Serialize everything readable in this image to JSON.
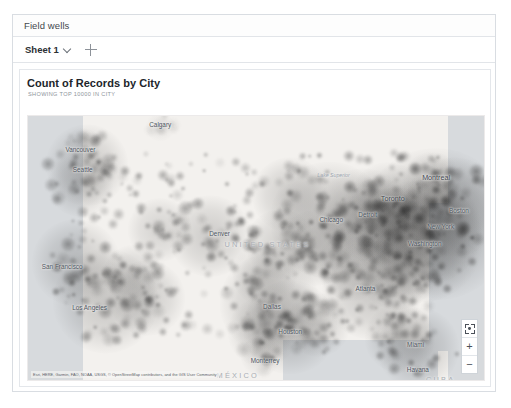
{
  "fieldwells": {
    "label": "Field wells"
  },
  "sheetbar": {
    "tab_label": "Sheet 1",
    "chevron_icon": "chevron-down-icon",
    "add_icon": "plus-icon"
  },
  "visual": {
    "title": "Count of Records by City",
    "subtitle": "SHOWING TOP 10000 IN CITY"
  },
  "map": {
    "attribution": "Esri, HERE, Garmin, FAO, NOAA, USGS, © OpenStreetMap contributors, and the GIS User Community",
    "controls": {
      "recenter_icon": "focus-recenter-icon",
      "zoom_in_label": "+",
      "zoom_out_label": "−"
    },
    "colors": {
      "land": "#f7f5f2",
      "water": "#d7dadd",
      "heat": "#4a4a4a",
      "card_border": "#e4e7eb",
      "panel_border": "#d9dde2"
    },
    "labels": [
      {
        "text": "Calgary",
        "x": 29.0,
        "y": 3.0,
        "kind": "city"
      },
      {
        "text": "Vancouver",
        "x": 11.5,
        "y": 12.5,
        "kind": "city"
      },
      {
        "text": "Seattle",
        "x": 12.0,
        "y": 20.0,
        "kind": "city"
      },
      {
        "text": "San Francisco",
        "x": 7.5,
        "y": 57.0,
        "kind": "city"
      },
      {
        "text": "Los Angeles",
        "x": 13.5,
        "y": 72.5,
        "kind": "city"
      },
      {
        "text": "Denver",
        "x": 42.0,
        "y": 44.5,
        "kind": "city"
      },
      {
        "text": "Dallas",
        "x": 53.5,
        "y": 72.0,
        "kind": "city"
      },
      {
        "text": "Houston",
        "x": 57.5,
        "y": 81.5,
        "kind": "city"
      },
      {
        "text": "Monterrey",
        "x": 52.0,
        "y": 92.5,
        "kind": "city"
      },
      {
        "text": "Chicago",
        "x": 66.5,
        "y": 39.0,
        "kind": "city"
      },
      {
        "text": "Detroit",
        "x": 74.5,
        "y": 37.0,
        "kind": "city"
      },
      {
        "text": "Toronto",
        "x": 80.0,
        "y": 31.0,
        "kind": "major"
      },
      {
        "text": "Montreal",
        "x": 89.5,
        "y": 23.0,
        "kind": "major"
      },
      {
        "text": "Boston",
        "x": 94.5,
        "y": 35.5,
        "kind": "city"
      },
      {
        "text": "New York",
        "x": 90.5,
        "y": 41.5,
        "kind": "city"
      },
      {
        "text": "Washington",
        "x": 87.0,
        "y": 48.0,
        "kind": "city"
      },
      {
        "text": "Atlanta",
        "x": 74.0,
        "y": 65.0,
        "kind": "city"
      },
      {
        "text": "Miami",
        "x": 85.0,
        "y": 86.5,
        "kind": "city"
      },
      {
        "text": "Havana",
        "x": 85.5,
        "y": 96.0,
        "kind": "city"
      },
      {
        "text": "UNITED STATES",
        "x": 52.5,
        "y": 48.5,
        "kind": "country"
      },
      {
        "text": "MÉXICO",
        "x": 46.0,
        "y": 98.0,
        "kind": "country"
      },
      {
        "text": "CUBA",
        "x": 90.5,
        "y": 99.5,
        "kind": "country"
      },
      {
        "text": "Lake Superior",
        "x": 67.0,
        "y": 22.5,
        "kind": "water-lbl"
      }
    ]
  },
  "chart_data": {
    "type": "heatmap",
    "title": "Count of Records by City",
    "subtitle": "SHOWING TOP 10000 IN CITY",
    "measure": "Count of Records",
    "dimension": "City",
    "top_n": 10000,
    "basemap": "light-gray",
    "colorscale": "grayscale-density",
    "region": "North America (contiguous United States)",
    "points": [
      {
        "name": "New York",
        "x": 89.5,
        "y": 41.0,
        "r": 13.0,
        "intensity": 1.0
      },
      {
        "name": "Washington DC",
        "x": 86.0,
        "y": 47.5,
        "r": 10.5,
        "intensity": 0.92
      },
      {
        "name": "Philadelphia",
        "x": 88.0,
        "y": 43.5,
        "r": 9.0,
        "intensity": 0.88
      },
      {
        "name": "Boston",
        "x": 93.5,
        "y": 34.5,
        "r": 8.5,
        "intensity": 0.84
      },
      {
        "name": "Chicago",
        "x": 66.0,
        "y": 39.5,
        "r": 10.0,
        "intensity": 0.86
      },
      {
        "name": "Detroit",
        "x": 73.5,
        "y": 37.5,
        "r": 8.0,
        "intensity": 0.78
      },
      {
        "name": "Cleveland",
        "x": 77.0,
        "y": 40.0,
        "r": 7.5,
        "intensity": 0.76
      },
      {
        "name": "Pittsburgh",
        "x": 80.5,
        "y": 42.5,
        "r": 7.0,
        "intensity": 0.72
      },
      {
        "name": "Toronto",
        "x": 79.0,
        "y": 32.0,
        "r": 6.5,
        "intensity": 0.62
      },
      {
        "name": "Montreal",
        "x": 88.5,
        "y": 24.5,
        "r": 5.0,
        "intensity": 0.5
      },
      {
        "name": "Atlanta",
        "x": 75.5,
        "y": 66.0,
        "r": 8.5,
        "intensity": 0.8
      },
      {
        "name": "Charlotte",
        "x": 81.0,
        "y": 58.0,
        "r": 7.0,
        "intensity": 0.72
      },
      {
        "name": "Miami",
        "x": 85.5,
        "y": 88.0,
        "r": 7.0,
        "intensity": 0.74
      },
      {
        "name": "Tampa",
        "x": 81.5,
        "y": 84.0,
        "r": 6.0,
        "intensity": 0.66
      },
      {
        "name": "Dallas",
        "x": 53.0,
        "y": 71.0,
        "r": 8.5,
        "intensity": 0.8
      },
      {
        "name": "Houston",
        "x": 57.5,
        "y": 80.0,
        "r": 8.0,
        "intensity": 0.78
      },
      {
        "name": "San Antonio",
        "x": 51.5,
        "y": 82.0,
        "r": 6.0,
        "intensity": 0.62
      },
      {
        "name": "Denver",
        "x": 40.0,
        "y": 45.5,
        "r": 7.0,
        "intensity": 0.72
      },
      {
        "name": "Phoenix",
        "x": 26.0,
        "y": 69.0,
        "r": 6.5,
        "intensity": 0.68
      },
      {
        "name": "Los Angeles",
        "x": 17.0,
        "y": 70.0,
        "r": 9.0,
        "intensity": 0.82
      },
      {
        "name": "San Francisco",
        "x": 10.5,
        "y": 55.5,
        "r": 7.5,
        "intensity": 0.76
      },
      {
        "name": "Seattle",
        "x": 13.0,
        "y": 18.5,
        "r": 7.0,
        "intensity": 0.74
      },
      {
        "name": "Portland",
        "x": 11.5,
        "y": 26.0,
        "r": 5.5,
        "intensity": 0.62
      },
      {
        "name": "Salt Lake City",
        "x": 29.0,
        "y": 43.0,
        "r": 5.5,
        "intensity": 0.58
      },
      {
        "name": "Minneapolis",
        "x": 57.5,
        "y": 30.0,
        "r": 6.5,
        "intensity": 0.68
      },
      {
        "name": "St. Louis",
        "x": 63.0,
        "y": 50.0,
        "r": 6.5,
        "intensity": 0.68
      },
      {
        "name": "Kansas City",
        "x": 55.5,
        "y": 48.5,
        "r": 6.0,
        "intensity": 0.64
      },
      {
        "name": "Nashville",
        "x": 71.0,
        "y": 57.0,
        "r": 6.0,
        "intensity": 0.66
      },
      {
        "name": "New Orleans",
        "x": 63.5,
        "y": 79.0,
        "r": 5.5,
        "intensity": 0.6
      },
      {
        "name": "Oklahoma City",
        "x": 52.0,
        "y": 60.0,
        "r": 5.5,
        "intensity": 0.6
      },
      {
        "name": "Las Vegas",
        "x": 23.0,
        "y": 60.0,
        "r": 5.0,
        "intensity": 0.56
      },
      {
        "name": "Monterrey",
        "x": 51.0,
        "y": 91.0,
        "r": 3.5,
        "intensity": 0.34
      },
      {
        "name": "Calgary",
        "x": 29.0,
        "y": 4.0,
        "r": 2.5,
        "intensity": 0.22
      },
      {
        "name": "Vancouver",
        "x": 12.0,
        "y": 11.0,
        "r": 3.0,
        "intensity": 0.3
      }
    ]
  }
}
